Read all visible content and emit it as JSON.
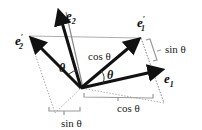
{
  "diagram": {
    "vectors": {
      "e1": {
        "label": "e",
        "sub": "1",
        "prime": ""
      },
      "e2": {
        "label": "e",
        "sub": "2",
        "prime": ""
      },
      "e1p": {
        "label": "e",
        "sub": "1",
        "prime": "′"
      },
      "e2p": {
        "label": "e",
        "sub": "2",
        "prime": "′"
      }
    },
    "angle_labels": [
      "θ",
      "θ"
    ],
    "measure_labels": {
      "cos_top": "cos θ",
      "sin_right": "sin θ",
      "cos_bottom": "cos θ",
      "sin_bottom": "sin θ"
    },
    "colors": {
      "arrow": "#111111",
      "guide": "#888888",
      "bracket": "#999999"
    }
  }
}
